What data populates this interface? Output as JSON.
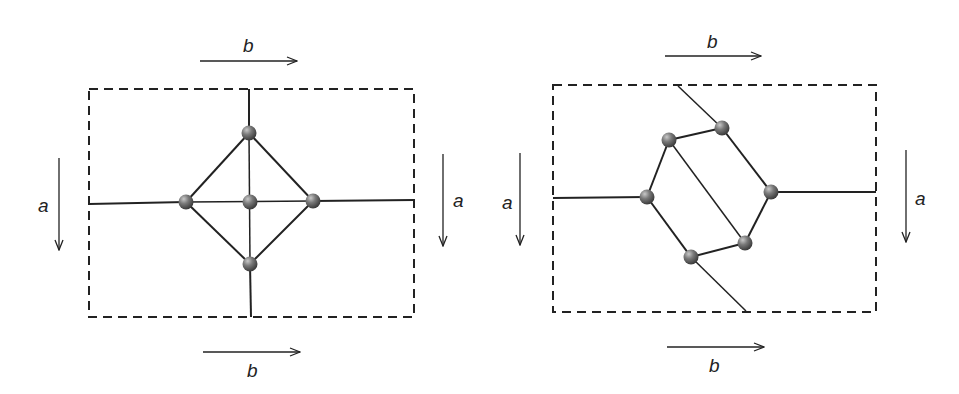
{
  "panels": [
    {
      "id": "left",
      "labels": {
        "top_b": "b",
        "bottom_b": "b",
        "left_a": "a",
        "right_a": "a"
      },
      "box": {
        "x": 89,
        "y": 89,
        "w": 325,
        "h": 228
      },
      "nodes": [
        {
          "id": "top",
          "x": 249,
          "y": 133
        },
        {
          "id": "left",
          "x": 186,
          "y": 202
        },
        {
          "id": "center",
          "x": 250,
          "y": 202
        },
        {
          "id": "right",
          "x": 313,
          "y": 201
        },
        {
          "id": "bottom",
          "x": 250,
          "y": 264
        }
      ]
    },
    {
      "id": "right",
      "labels": {
        "top_b": "b",
        "bottom_b": "b",
        "left_a": "a",
        "right_a": "a"
      },
      "box": {
        "x": 553,
        "y": 85,
        "w": 323,
        "h": 227
      },
      "nodes": [
        {
          "id": "n1",
          "x": 669,
          "y": 140
        },
        {
          "id": "n2",
          "x": 722,
          "y": 128
        },
        {
          "id": "n3",
          "x": 647,
          "y": 197
        },
        {
          "id": "n4",
          "x": 771,
          "y": 192
        },
        {
          "id": "n5",
          "x": 745,
          "y": 243
        },
        {
          "id": "n6",
          "x": 691,
          "y": 257
        }
      ]
    }
  ],
  "colors": {
    "line": "#222222",
    "node": "#6e6e6e",
    "node_highlight": "#bdbdbd"
  }
}
